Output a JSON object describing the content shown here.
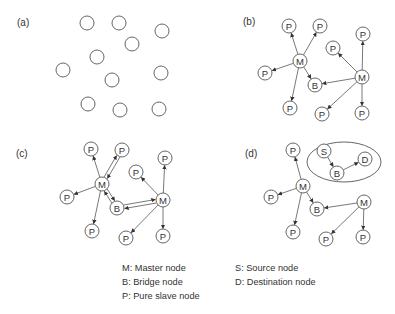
{
  "colors": {
    "background": "#ffffff",
    "stroke": "#555555",
    "text": "#333333"
  },
  "node_radius": 7,
  "panels": [
    {
      "id": "a",
      "label": "(a)",
      "label_pos": [
        17,
        26
      ],
      "nodes": [
        {
          "id": "a1",
          "x": 87,
          "y": 23,
          "text": ""
        },
        {
          "id": "a2",
          "x": 119,
          "y": 23,
          "text": ""
        },
        {
          "id": "a3",
          "x": 162,
          "y": 31,
          "text": ""
        },
        {
          "id": "a4",
          "x": 132,
          "y": 44,
          "text": ""
        },
        {
          "id": "a5",
          "x": 97,
          "y": 57,
          "text": ""
        },
        {
          "id": "a6",
          "x": 63,
          "y": 70,
          "text": ""
        },
        {
          "id": "a7",
          "x": 161,
          "y": 73,
          "text": ""
        },
        {
          "id": "a8",
          "x": 112,
          "y": 80,
          "text": ""
        },
        {
          "id": "a9",
          "x": 88,
          "y": 104,
          "text": ""
        },
        {
          "id": "a10",
          "x": 120,
          "y": 110,
          "text": ""
        },
        {
          "id": "a11",
          "x": 159,
          "y": 109,
          "text": ""
        }
      ],
      "edges": []
    },
    {
      "id": "b",
      "label": "(b)",
      "label_pos": [
        243,
        25
      ],
      "nodes": [
        {
          "id": "b_p1",
          "x": 289,
          "y": 26,
          "text": "P"
        },
        {
          "id": "b_p2",
          "x": 320,
          "y": 26,
          "text": "P"
        },
        {
          "id": "b_m1",
          "x": 300,
          "y": 61,
          "text": "M"
        },
        {
          "id": "b_p3",
          "x": 265,
          "y": 73,
          "text": "P"
        },
        {
          "id": "b_b",
          "x": 315,
          "y": 85,
          "text": "B"
        },
        {
          "id": "b_p4",
          "x": 290,
          "y": 108,
          "text": "P"
        },
        {
          "id": "b_p5",
          "x": 333,
          "y": 48,
          "text": "P"
        },
        {
          "id": "b_p6",
          "x": 363,
          "y": 34,
          "text": "P"
        },
        {
          "id": "b_m2",
          "x": 362,
          "y": 77,
          "text": "M"
        },
        {
          "id": "b_p7",
          "x": 322,
          "y": 114,
          "text": "P"
        },
        {
          "id": "b_p8",
          "x": 362,
          "y": 113,
          "text": "P"
        }
      ],
      "edges": [
        {
          "from": "b_m1",
          "to": "b_p1"
        },
        {
          "from": "b_m1",
          "to": "b_p2"
        },
        {
          "from": "b_m1",
          "to": "b_p3"
        },
        {
          "from": "b_m1",
          "to": "b_b"
        },
        {
          "from": "b_m1",
          "to": "b_p4"
        },
        {
          "from": "b_m2",
          "to": "b_p5"
        },
        {
          "from": "b_m2",
          "to": "b_p6"
        },
        {
          "from": "b_m2",
          "to": "b_b"
        },
        {
          "from": "b_m2",
          "to": "b_p7"
        },
        {
          "from": "b_m2",
          "to": "b_p8"
        }
      ]
    },
    {
      "id": "c",
      "label": "(c)",
      "label_pos": [
        16,
        157
      ],
      "nodes": [
        {
          "id": "c_p1",
          "x": 91,
          "y": 149,
          "text": "P"
        },
        {
          "id": "c_p2",
          "x": 122,
          "y": 150,
          "text": "P"
        },
        {
          "id": "c_m1",
          "x": 102,
          "y": 184,
          "text": "M"
        },
        {
          "id": "c_p3",
          "x": 67,
          "y": 197,
          "text": "P"
        },
        {
          "id": "c_b",
          "x": 117,
          "y": 208,
          "text": "B"
        },
        {
          "id": "c_p4",
          "x": 92,
          "y": 231,
          "text": "P"
        },
        {
          "id": "c_p5",
          "x": 136,
          "y": 172,
          "text": "P"
        },
        {
          "id": "c_p6",
          "x": 165,
          "y": 158,
          "text": "P"
        },
        {
          "id": "c_m2",
          "x": 163,
          "y": 200,
          "text": "M"
        },
        {
          "id": "c_p7",
          "x": 126,
          "y": 238,
          "text": "P"
        },
        {
          "id": "c_p8",
          "x": 163,
          "y": 236,
          "text": "P"
        }
      ],
      "edges": [
        {
          "from": "c_m1",
          "to": "c_p1"
        },
        {
          "from": "c_m1",
          "to": "c_p2",
          "offset": -1.8
        },
        {
          "from": "c_p2",
          "to": "c_m1",
          "offset": -1.8
        },
        {
          "from": "c_m1",
          "to": "c_p3"
        },
        {
          "from": "c_m1",
          "to": "c_b",
          "offset": -1.8
        },
        {
          "from": "c_b",
          "to": "c_m1",
          "offset": -1.8
        },
        {
          "from": "c_m1",
          "to": "c_p4"
        },
        {
          "from": "c_m2",
          "to": "c_p5"
        },
        {
          "from": "c_m2",
          "to": "c_p6"
        },
        {
          "from": "c_m2",
          "to": "c_b",
          "offset": -1.8
        },
        {
          "from": "c_b",
          "to": "c_m2",
          "offset": -1.8
        },
        {
          "from": "c_m2",
          "to": "c_p7"
        },
        {
          "from": "c_m2",
          "to": "c_p8"
        }
      ]
    },
    {
      "id": "d",
      "label": "(d)",
      "label_pos": [
        245,
        157
      ],
      "ellipse": {
        "cx": 344,
        "cy": 162,
        "rx": 37,
        "ry": 20
      },
      "nodes": [
        {
          "id": "d_p1",
          "x": 293,
          "y": 150,
          "text": "P"
        },
        {
          "id": "d_s",
          "x": 324,
          "y": 151,
          "text": "S"
        },
        {
          "id": "d_d",
          "x": 365,
          "y": 159,
          "text": "D"
        },
        {
          "id": "d_b1",
          "x": 337,
          "y": 173,
          "text": "B"
        },
        {
          "id": "d_m1",
          "x": 303,
          "y": 186,
          "text": "M"
        },
        {
          "id": "d_p2",
          "x": 271,
          "y": 197,
          "text": "P"
        },
        {
          "id": "d_b2",
          "x": 317,
          "y": 209,
          "text": "B"
        },
        {
          "id": "d_p3",
          "x": 293,
          "y": 232,
          "text": "P"
        },
        {
          "id": "d_m2",
          "x": 364,
          "y": 202,
          "text": "M"
        },
        {
          "id": "d_p4",
          "x": 326,
          "y": 239,
          "text": "P"
        },
        {
          "id": "d_p5",
          "x": 363,
          "y": 237,
          "text": "P"
        }
      ],
      "edges": [
        {
          "from": "d_s",
          "to": "d_b1"
        },
        {
          "from": "d_b1",
          "to": "d_d"
        },
        {
          "from": "d_m1",
          "to": "d_p1"
        },
        {
          "from": "d_m1",
          "to": "d_p2"
        },
        {
          "from": "d_m1",
          "to": "d_b2"
        },
        {
          "from": "d_m1",
          "to": "d_p3"
        },
        {
          "from": "d_m2",
          "to": "d_b2"
        },
        {
          "from": "d_m2",
          "to": "d_p4"
        },
        {
          "from": "d_m2",
          "to": "d_p5"
        }
      ]
    }
  ],
  "legend": {
    "col1": [
      "M: Master node",
      "B: Bridge node",
      "P: Pure slave node"
    ],
    "col2": [
      "S: Source node",
      "D: Destination node"
    ]
  }
}
